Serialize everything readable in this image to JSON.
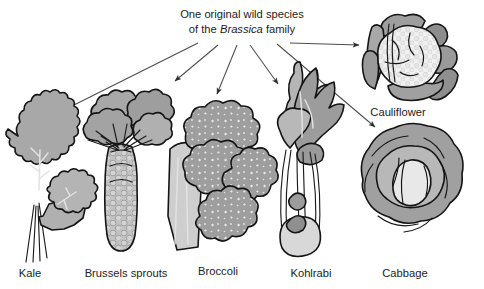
{
  "figure": {
    "type": "diagram",
    "background_color": "#ffffff",
    "title": {
      "line1": "One original wild species",
      "line2_prefix": "of the ",
      "line2_italic": "Brassica",
      "line2_suffix": " family"
    },
    "palette": {
      "leaf_mid": "#a3a3a3",
      "leaf_dark": "#8c8c8c",
      "leaf_light": "#c6c6c6",
      "leaf_pale": "#dcdcdc",
      "head_white": "#f0f0f0",
      "outline": "#141414",
      "arrow": "#4d4d4d",
      "text": "#1c1c1c"
    },
    "crops": [
      {
        "id": "kale",
        "label": "Kale",
        "label_x": 30,
        "label_y": 277,
        "arrow": {
          "name": "arrow-to-kale",
          "from_x": 198,
          "from_y": 43,
          "to_x": 63,
          "to_y": 111
        }
      },
      {
        "id": "brussels-sprouts",
        "label": "Brussels sprouts",
        "label_x": 126,
        "label_y": 277,
        "arrow": {
          "name": "arrow-to-brussels-sprouts",
          "from_x": 218,
          "from_y": 45,
          "to_x": 172,
          "to_y": 84
        }
      },
      {
        "id": "broccoli",
        "label": "Broccoli",
        "label_x": 218,
        "label_y": 275,
        "arrow": {
          "name": "arrow-to-broccoli",
          "from_x": 237,
          "from_y": 45,
          "to_x": 217,
          "to_y": 99
        }
      },
      {
        "id": "kohlrabi",
        "label": "Kohlrabi",
        "label_x": 311,
        "label_y": 277,
        "arrow": {
          "name": "arrow-to-kohlrabi",
          "from_x": 250,
          "from_y": 45,
          "to_x": 280,
          "to_y": 88
        }
      },
      {
        "id": "cabbage",
        "label": "Cabbage",
        "label_x": 405,
        "label_y": 277,
        "arrow": {
          "name": "arrow-to-cabbage",
          "from_x": 277,
          "from_y": 44,
          "to_x": 378,
          "to_y": 130
        }
      },
      {
        "id": "cauliflower",
        "label": "Cauliflower",
        "label_x": 398,
        "label_y": 116,
        "arrow": {
          "name": "arrow-to-cauliflower",
          "from_x": 290,
          "from_y": 43,
          "to_x": 363,
          "to_y": 45
        }
      }
    ]
  }
}
